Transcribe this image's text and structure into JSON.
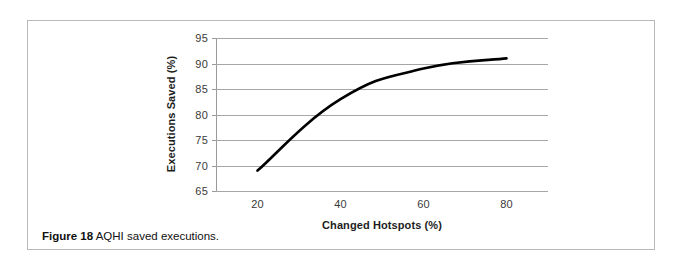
{
  "caption": {
    "label": "Figure 18",
    "text": "AQHI saved executions."
  },
  "chart_data": {
    "type": "line",
    "title": "",
    "xlabel": "Changed Hotspots (%)",
    "ylabel": "Executions Saved (%)",
    "x": [
      20,
      40,
      60,
      80
    ],
    "values": [
      69,
      83,
      89,
      91
    ],
    "series": [
      {
        "name": "AQHI",
        "values": [
          69,
          83,
          89,
          91
        ]
      }
    ],
    "xlim": [
      10,
      90
    ],
    "ylim": [
      65,
      95
    ],
    "xticks": [
      20,
      40,
      60,
      80
    ],
    "yticks": [
      65,
      70,
      75,
      80,
      85,
      90,
      95
    ],
    "grid": "horizontal",
    "legend": "none",
    "line_color": "#000000",
    "line_width": 2.6,
    "smooth": true
  },
  "colors": {
    "frame": "#b9b9b9",
    "gridline": "#a6a6a6",
    "axis": "#9a9a9a",
    "text": "#1d1d1d",
    "background": "#ffffff"
  }
}
